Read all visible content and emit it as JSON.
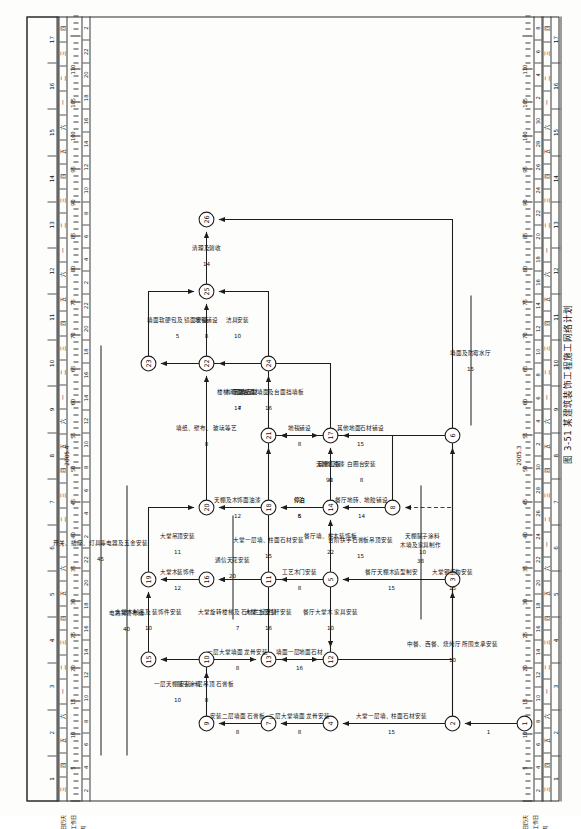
{
  "figure": {
    "caption": "图 3-51  某建筑装饰工程施工网络计划",
    "sheet_title": ""
  },
  "calendar": {
    "year_label_top": "2005.4",
    "year_label_bottom": "2005.3",
    "corner_labels": [
      "日历天",
      "工作日",
      "月"
    ],
    "scale_unit_marks": [
      5,
      10,
      15,
      20,
      25,
      30,
      35,
      40,
      45,
      50,
      55,
      60,
      65,
      70,
      75,
      80,
      85,
      90,
      95,
      100,
      105,
      110
    ],
    "week_numbers": [
      1,
      2,
      3,
      4,
      5,
      6,
      7,
      8,
      9,
      10,
      11,
      12,
      13,
      14,
      15,
      16,
      17
    ],
    "day_cells_top": [
      "2",
      "4",
      "6",
      "8",
      "10",
      "12",
      "14",
      "16",
      "18",
      "20",
      "22"
    ],
    "day_cells_bottom": [
      "2",
      "4",
      "6",
      "8",
      "10",
      "12",
      "14",
      "16",
      "18",
      "20",
      "22",
      "24",
      "26",
      "28",
      "30"
    ],
    "month_marks": [
      "三",
      "四",
      "五",
      "六",
      "一",
      "二",
      "三",
      "四",
      "五",
      "六",
      "一",
      "二",
      "三",
      "四",
      "五",
      "六",
      "一",
      "二",
      "三",
      "四",
      "五",
      "六",
      "一",
      "二",
      "三",
      "四",
      "五",
      "六",
      "一",
      "二",
      "三",
      "四"
    ]
  },
  "chart_data": {
    "type": "network-diagram",
    "title": "某建筑装饰工程施工网络计划",
    "node_count": 26,
    "nodes": [
      {
        "id": 1,
        "label": "1",
        "x": 92,
        "y": 524
      },
      {
        "id": 2,
        "label": "2",
        "x": 92,
        "y": 452
      },
      {
        "id": 3,
        "label": "3",
        "x": 236,
        "y": 452
      },
      {
        "id": 4,
        "label": "4",
        "x": 92,
        "y": 330
      },
      {
        "id": 5,
        "label": "5",
        "x": 236,
        "y": 330
      },
      {
        "id": 6,
        "label": "6",
        "x": 380,
        "y": 452
      },
      {
        "id": 7,
        "label": "7",
        "x": 92,
        "y": 268
      },
      {
        "id": 8,
        "label": "8",
        "x": 308,
        "y": 392
      },
      {
        "id": 9,
        "label": "9",
        "x": 92,
        "y": 206
      },
      {
        "id": 10,
        "label": "10",
        "x": 156,
        "y": 206
      },
      {
        "id": 11,
        "label": "11",
        "x": 236,
        "y": 268
      },
      {
        "id": 12,
        "label": "12",
        "x": 156,
        "y": 330
      },
      {
        "id": 13,
        "label": "13",
        "x": 156,
        "y": 268
      },
      {
        "id": 14,
        "label": "14",
        "x": 308,
        "y": 330
      },
      {
        "id": 15,
        "label": "15",
        "x": 156,
        "y": 148
      },
      {
        "id": 16,
        "label": "16",
        "x": 236,
        "y": 206
      },
      {
        "id": 17,
        "label": "17",
        "x": 380,
        "y": 330
      },
      {
        "id": 18,
        "label": "18",
        "x": 308,
        "y": 268
      },
      {
        "id": 19,
        "label": "19",
        "x": 236,
        "y": 148
      },
      {
        "id": 20,
        "label": "20",
        "x": 308,
        "y": 206
      },
      {
        "id": 21,
        "label": "21",
        "x": 380,
        "y": 268
      },
      {
        "id": 22,
        "label": "22",
        "x": 452,
        "y": 206
      },
      {
        "id": 23,
        "label": "23",
        "x": 452,
        "y": 148
      },
      {
        "id": 24,
        "label": "24",
        "x": 452,
        "y": 268
      },
      {
        "id": 25,
        "label": "25",
        "x": 524,
        "y": 206
      },
      {
        "id": 26,
        "label": "26",
        "x": 596,
        "y": 206
      }
    ],
    "activities": [
      {
        "from": 1,
        "to": 2,
        "name": "",
        "duration": 1
      },
      {
        "from": 2,
        "to": 4,
        "name": "大堂一层墙、柱面石材安装",
        "duration": 15
      },
      {
        "from": 2,
        "to": 3,
        "name": "中餐、西餐、烧烤厅 所围支承安装",
        "duration": 10
      },
      {
        "from": 2,
        "to": 6,
        "name": "大堂钢结构安装",
        "duration": 15
      },
      {
        "from": 3,
        "to": 5,
        "name": "餐厅天棚木造型制安",
        "duration": 15
      },
      {
        "from": 3,
        "to": 8,
        "name": "天棚腻子涂料",
        "duration": 10
      },
      {
        "from": 4,
        "to": 7,
        "name": "二层大堂墙面 龙骨安装",
        "duration": 8
      },
      {
        "from": 5,
        "to": 11,
        "name": "工艺木门安装",
        "duration": 8
      },
      {
        "from": 5,
        "to": 14,
        "name": "餐厅墙、柱木装饰板",
        "duration": 22
      },
      {
        "from": 5,
        "to": 12,
        "name": "餐厅大堂木 家具安装",
        "duration": 10
      },
      {
        "from": 6,
        "to": 13,
        "name": "台阶扶手石膏板吊顶安装",
        "duration": 15
      },
      {
        "from": 7,
        "to": 9,
        "name": "安装二层墙面 石膏板",
        "duration": 8
      },
      {
        "from": 8,
        "to": 14,
        "name": "餐厅地砖、地胶铺设",
        "duration": 14
      },
      {
        "from": 9,
        "to": 15,
        "name": "一层天棚腻子涂料",
        "duration": 10
      },
      {
        "from": 9,
        "to": 10,
        "name": "安装一层吊顶 石膏板",
        "duration": 8
      },
      {
        "from": 10,
        "to": 13,
        "name": "一层大堂墙面 龙骨安装",
        "duration": 8
      },
      {
        "from": 12,
        "to": 16,
        "name": "大堂二层栏杆安装",
        "duration": 16
      },
      {
        "from": 13,
        "to": 12,
        "name": "墙面一层地面石材",
        "duration": 16
      },
      {
        "from": 13,
        "to": 16,
        "name": "大堂旋转楼梯及 石材栏板安装",
        "duration": 7
      },
      {
        "from": 14,
        "to": 17,
        "name": "天棚乳胶漆",
        "duration": 8
      },
      {
        "from": 14,
        "to": 18,
        "name": "停泊",
        "duration": 5
      },
      {
        "from": 15,
        "to": 19,
        "name": "大堂木制品及 装饰件安装",
        "duration": 10
      },
      {
        "from": 16,
        "to": 19,
        "name": "大堂木装饰件",
        "duration": 12
      },
      {
        "from": 17,
        "to": 21,
        "name": "地毯铺设",
        "duration": 8
      },
      {
        "from": 18,
        "to": 20,
        "name": "天棚及木饰面油漆",
        "duration": 12
      },
      {
        "from": 19,
        "to": 20,
        "name": "大堂吊顶安装",
        "duration": 11
      },
      {
        "from": 20,
        "to": 22,
        "name": "墙纸、壁布、 玻璃等艺",
        "duration": 8
      },
      {
        "from": 21,
        "to": 22,
        "name": "楼梯间隔墙石材",
        "duration": 14
      },
      {
        "from": 22,
        "to": 25,
        "name": "地毯铺设",
        "duration": 8
      },
      {
        "from": 23,
        "to": 25,
        "name": "墙面软硬包及 镜面安装",
        "duration": 5
      },
      {
        "from": 24,
        "to": 25,
        "name": "洁具安装",
        "duration": 10
      },
      {
        "from": 25,
        "to": 26,
        "name": "清理及验收",
        "duration": 14
      },
      {
        "from": 21,
        "to": 24,
        "name": "艺术造型墙面及台面挡墙板",
        "duration": 16
      },
      {
        "from": 6,
        "to": 21,
        "name": "其他地面石材铺设",
        "duration": 15
      },
      {
        "from": 13,
        "to": 21,
        "name": "大堂一层墙、柱面石材安装",
        "duration": 15
      },
      {
        "from": 8,
        "to": 17,
        "name": "白圈台安装",
        "duration": 8
      },
      {
        "from": 11,
        "to": 17,
        "name": "停泊",
        "duration": 6
      },
      {
        "from": 17,
        "to": 23,
        "name": "木饰面油漆",
        "duration": 7
      },
      {
        "from": 2,
        "to": 26,
        "name": "其他工程",
        "duration": 90
      }
    ],
    "side_activities": [
      {
        "name": "电路排管布线",
        "duration": 40
      },
      {
        "name": "开关、插座、灯具等电器及五金安装",
        "duration": 45
      },
      {
        "name": "通信天花安装",
        "duration": 20
      },
      {
        "name": "木墙及家具制作",
        "duration": 38
      },
      {
        "name": "墙面及防霉水厅",
        "duration": 15
      },
      {
        "name": "大堂钢结构安装",
        "duration": 15
      },
      {
        "name": "设施及卫生间 石材安装",
        "duration": 15
      }
    ]
  },
  "colors": {
    "ink": "#1d1d1d",
    "paper": "#fdfdfc",
    "rule": "#3a3a3a"
  }
}
